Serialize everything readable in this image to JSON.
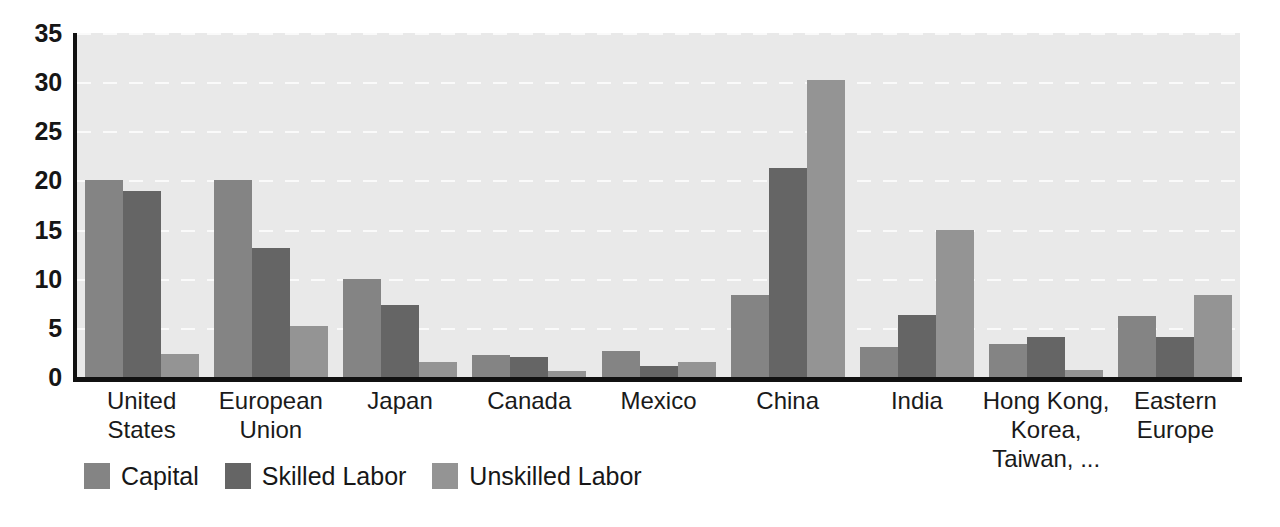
{
  "chart_data": {
    "type": "bar",
    "title": "",
    "subtitle": "",
    "xlabel": "",
    "ylabel": "",
    "ylim": [
      0,
      35
    ],
    "yticks": [
      0,
      5,
      10,
      15,
      20,
      25,
      30,
      35
    ],
    "grid": true,
    "grid_style": "dashed-horizontal-white",
    "legend_position": "bottom-left",
    "categories": [
      "United\nStates",
      "European\nUnion",
      "Japan",
      "Canada",
      "Mexico",
      "China",
      "India",
      "Hong Kong,\nKorea,\nTaiwan, ...",
      "Eastern\nEurope"
    ],
    "series": [
      {
        "name": "Capital",
        "color": "#848484",
        "values": [
          20.0,
          20.0,
          10.0,
          2.2,
          2.6,
          8.3,
          3.1,
          3.4,
          6.2
        ]
      },
      {
        "name": "Skilled Labor",
        "color": "#656565",
        "values": [
          18.9,
          13.1,
          7.3,
          2.0,
          1.1,
          21.3,
          6.3,
          4.1,
          4.1
        ]
      },
      {
        "name": "Unskilled Labor",
        "color": "#949494",
        "values": [
          2.3,
          5.2,
          1.5,
          0.6,
          1.5,
          30.2,
          15.0,
          0.7,
          8.3
        ]
      }
    ]
  },
  "colors": {
    "plot_background": "#e9e9e9",
    "axis": "#111111",
    "gridline": "#fbfbfb",
    "page_background": "#ffffff",
    "text": "#1a1a1a"
  }
}
